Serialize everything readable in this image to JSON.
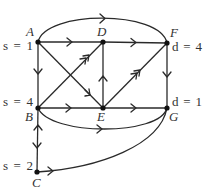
{
  "diagram": {
    "type": "directed-network",
    "nodes": [
      {
        "id": "A",
        "label": "A",
        "annotation": "s = 1",
        "x": 38,
        "y": 42
      },
      {
        "id": "D",
        "label": "D",
        "annotation": "",
        "x": 103,
        "y": 42
      },
      {
        "id": "F",
        "label": "F",
        "annotation": "d = 4",
        "x": 167,
        "y": 43
      },
      {
        "id": "B",
        "label": "B",
        "annotation": "s = 4",
        "x": 38,
        "y": 108
      },
      {
        "id": "E",
        "label": "E",
        "annotation": "",
        "x": 103,
        "y": 108
      },
      {
        "id": "G",
        "label": "G",
        "annotation": "d = 1",
        "x": 167,
        "y": 108
      },
      {
        "id": "C",
        "label": "C",
        "annotation": "s = 2",
        "x": 37,
        "y": 172
      }
    ],
    "edges": [
      {
        "from": "A",
        "to": "F",
        "shape": "arc-top",
        "arrows": 1
      },
      {
        "from": "A",
        "to": "D",
        "shape": "straight",
        "arrows": 1
      },
      {
        "from": "D",
        "to": "F",
        "shape": "straight",
        "arrows": 1
      },
      {
        "from": "A",
        "to": "B",
        "shape": "straight",
        "arrows": 1
      },
      {
        "from": "F",
        "to": "G",
        "shape": "straight",
        "arrows": 1
      },
      {
        "from": "A",
        "to": "E",
        "shape": "straight",
        "arrows": 1
      },
      {
        "from": "B",
        "to": "D",
        "shape": "straight",
        "arrows": 2
      },
      {
        "from": "E",
        "to": "D",
        "shape": "straight",
        "arrows": 1
      },
      {
        "from": "E",
        "to": "F",
        "shape": "straight",
        "arrows": 2
      },
      {
        "from": "B",
        "to": "E",
        "shape": "straight",
        "arrows": 1
      },
      {
        "from": "E",
        "to": "G",
        "shape": "straight",
        "arrows": 1
      },
      {
        "from": "B",
        "to": "G",
        "shape": "arc-bottom",
        "arrows": 1
      },
      {
        "from": "B",
        "to": "C",
        "shape": "straight",
        "arrows": "bidirectional"
      },
      {
        "from": "C",
        "to": "G",
        "shape": "curve",
        "arrows": 1
      }
    ]
  },
  "labels": {
    "A": "A",
    "A_s": "s = 1",
    "D": "D",
    "F": "F",
    "F_d": "d = 4",
    "B": "B",
    "B_s": "s = 4",
    "E": "E",
    "G": "G",
    "G_d": "d = 1",
    "C": "C",
    "C_s": "s = 2"
  }
}
